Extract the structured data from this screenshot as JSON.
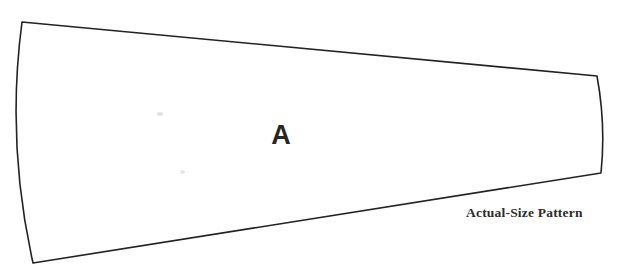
{
  "document": {
    "type": "sewing-pattern-piece",
    "background_color": "#ffffff"
  },
  "pattern": {
    "piece_label": "A",
    "caption": "Actual-Size Pattern",
    "outline_color": "#222222",
    "fill_color": "#ffffff",
    "stroke_width": 1.6,
    "shape": "tapered-wedge",
    "vertices": [
      {
        "name": "top-left",
        "x": 22,
        "y": 22
      },
      {
        "name": "top-right",
        "x": 597,
        "y": 76
      },
      {
        "name": "bottom-right",
        "x": 601,
        "y": 173
      },
      {
        "name": "bottom-left",
        "x": 33,
        "y": 263
      }
    ],
    "edges": [
      {
        "name": "top-edge",
        "curvature": "straight"
      },
      {
        "name": "right-edge",
        "curvature": "slight-outward-bow",
        "control_x": 606,
        "control_y": 125
      },
      {
        "name": "bottom-edge",
        "curvature": "straight"
      },
      {
        "name": "left-edge",
        "curvature": "outward-bow",
        "control_x": 6,
        "control_y": 142
      }
    ]
  },
  "artifacts": {
    "specks": [
      {
        "name": "scan-speck-upper",
        "x": 157,
        "y": 112,
        "color": "#d9d9d9"
      },
      {
        "name": "scan-speck-lower",
        "x": 180,
        "y": 170,
        "color": "#d9d9d9"
      }
    ]
  }
}
